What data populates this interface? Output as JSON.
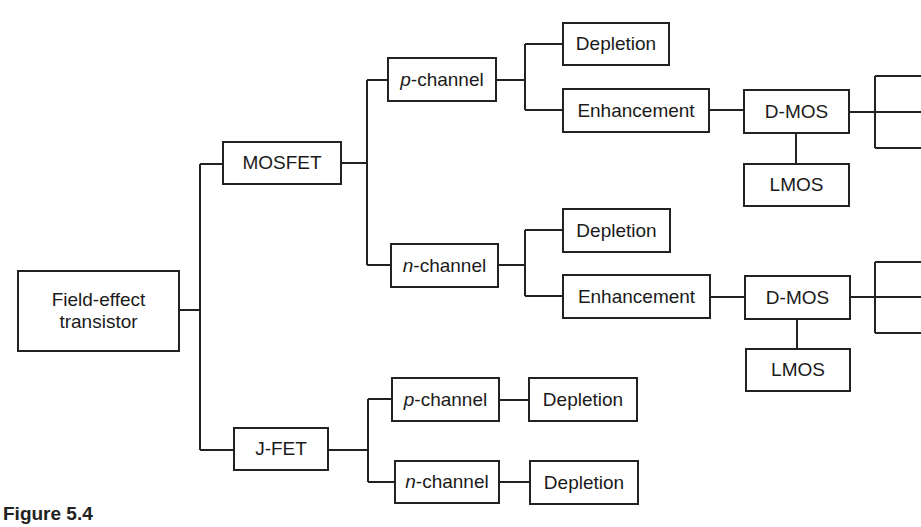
{
  "diagram": {
    "root": {
      "line1": "Field-effect",
      "line2": "transistor"
    },
    "mosfet": {
      "label": "MOSFET",
      "p_channel": {
        "prefix": "p",
        "suffix": "-channel",
        "depletion": "Depletion",
        "enhancement": "Enhancement",
        "dmos": "D-MOS",
        "lmos": "LMOS"
      },
      "n_channel": {
        "prefix": "n",
        "suffix": "-channel",
        "depletion": "Depletion",
        "enhancement": "Enhancement",
        "dmos": "D-MOS",
        "lmos": "LMOS"
      }
    },
    "jfet": {
      "label": "J-FET",
      "p_channel": {
        "prefix": "p",
        "suffix": "-channel",
        "depletion": "Depletion"
      },
      "n_channel": {
        "prefix": "n",
        "suffix": "-channel",
        "depletion": "Depletion"
      }
    }
  },
  "caption": "Figure 5.4",
  "colors": {
    "line": "#222222",
    "background": "#ffffff"
  }
}
